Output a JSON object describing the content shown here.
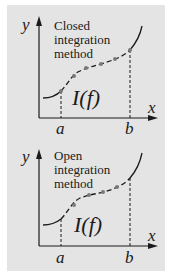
{
  "colors": {
    "background": "#ffffff",
    "panel": "#e4e4e4",
    "ink": "#1a1a1a",
    "point": "#7a7a7a"
  },
  "diagrams": [
    {
      "label_line1": "Closed",
      "label_line2": "integration",
      "label_line3": "method",
      "y_axis_label": "y",
      "x_axis_label": "x",
      "integral_label": "I(f)",
      "lower_bound_label": "a",
      "upper_bound_label": "b"
    },
    {
      "label_line1": "Open",
      "label_line2": "integration",
      "label_line3": "method",
      "y_axis_label": "y",
      "x_axis_label": "x",
      "integral_label": "I(f)",
      "lower_bound_label": "a",
      "upper_bound_label": "b"
    }
  ]
}
